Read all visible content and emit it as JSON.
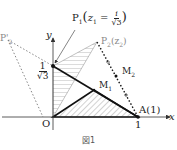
{
  "figure": {
    "caption": "図1",
    "axes": {
      "x_label": "x",
      "y_label": "y",
      "origin_label": "O",
      "x_tick": "1",
      "y_tick_num": "1",
      "y_tick_den": "√3"
    },
    "points": {
      "P1": {
        "label": "P",
        "sub": "1",
        "expr_pre": "z",
        "expr_sub": "1",
        "expr_eq": " = ",
        "expr_num": "i",
        "expr_den": "√3"
      },
      "P2": {
        "label": "P",
        "sub": "2",
        "expr": "(z",
        "expr_sub": "2",
        "expr_close": ")"
      },
      "P2prime": {
        "label": "P'",
        "sub": "2"
      },
      "M1": {
        "label": "M",
        "sub": "1"
      },
      "M2": {
        "label": "M",
        "sub": "2"
      },
      "A": {
        "label": "A",
        "value": "(1)"
      }
    },
    "colors": {
      "line": "#111111",
      "dotted": "#444444",
      "gray_label": "#888888",
      "hatch": "#777777"
    }
  }
}
